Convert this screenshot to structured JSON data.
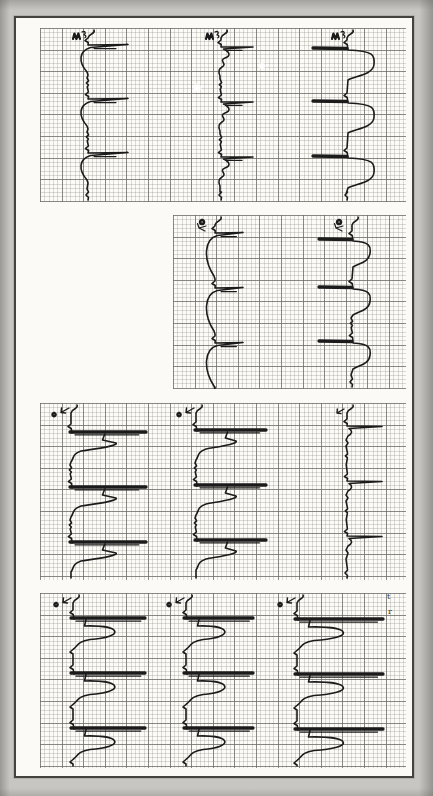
{
  "colors": {
    "background": "#c7c6c2",
    "page": "#fbfaf6",
    "page_border": "#45433e",
    "grid_major": "rgba(110,108,102,0.75)",
    "grid_minor": "rgba(125,122,112,0.26)",
    "trace": "#1b1b1b"
  },
  "chart_data": {
    "type": "line",
    "paper": {
      "minor_square_px": 4.32,
      "major_square_px": 21.6
    },
    "page": {
      "x": 14,
      "y": 16,
      "w": 400,
      "h": 762
    },
    "panels": [
      {
        "name": "panel-1",
        "x": 40,
        "y": 28,
        "w": 366,
        "h": 174,
        "strips": [
          {
            "name": "p1-s1",
            "x": 88,
            "mark": "m-squiggle",
            "style": "spike-t-left",
            "beats": [
              46,
              100,
              154
            ],
            "spike": 40,
            "t_amp": 9,
            "t_len": 26
          },
          {
            "name": "p1-s2",
            "x": 221,
            "mark": "m-squiggle",
            "style": "spike-s",
            "beats": [
              48,
              103,
              158
            ],
            "spike": 32
          },
          {
            "name": "p1-s3",
            "x": 347,
            "mark": "m-squiggle",
            "style": "bar-hump",
            "beats": [
              48,
              101,
              156
            ],
            "bar": 34,
            "hump": 27,
            "hump_len": 30
          }
        ]
      },
      {
        "name": "panel-2",
        "x": 173,
        "y": 215,
        "w": 233,
        "h": 174,
        "strips": [
          {
            "name": "p2-s1",
            "x": 215,
            "mark": "dot-squiggle",
            "style": "spike-t-left",
            "beats": [
              234,
              289,
              344
            ],
            "spike": 28,
            "t_amp": 11,
            "t_len": 42
          },
          {
            "name": "p2-s2",
            "x": 352,
            "mark": "dot-squiggle",
            "style": "bar-hump",
            "beats": [
              239,
              287,
              341
            ],
            "bar": 33,
            "hump": 18,
            "hump_len": 26
          }
        ]
      },
      {
        "name": "panel-3",
        "x": 40,
        "y": 403,
        "w": 366,
        "h": 177,
        "strips": [
          {
            "name": "p3-s1",
            "x": 71,
            "mark": "dot-arrow",
            "style": "thick-hump",
            "beats": [
              432,
              487,
              542
            ],
            "spike": 75,
            "hump": 45
          },
          {
            "name": "p3-s2",
            "x": 196,
            "mark": "dot-arrow",
            "style": "thick-hump",
            "beats": [
              430,
              485,
              540
            ],
            "spike": 70,
            "hump": 40
          },
          {
            "name": "p3-s3",
            "x": 347,
            "mark": "arrow",
            "style": "thin-spike",
            "beats": [
              427,
              482,
              537
            ],
            "spike": 35
          }
        ]
      },
      {
        "name": "panel-4",
        "x": 40,
        "y": 593,
        "w": 366,
        "h": 175,
        "strips": [
          {
            "name": "p4-s1",
            "x": 73,
            "mark": "dot-arrow",
            "style": "thick-bighump",
            "beats": [
              618,
              673,
              728
            ],
            "spike": 72,
            "hump": 50
          },
          {
            "name": "p4-s2",
            "x": 186,
            "mark": "dot-arrow",
            "style": "thick-bighump",
            "beats": [
              618,
              673,
              728
            ],
            "spike": 67,
            "hump": 46
          },
          {
            "name": "p4-s3",
            "x": 297,
            "mark": "dot-arrow",
            "style": "thick-bighump",
            "beats": [
              619,
              674,
              729
            ],
            "spike": 86,
            "hump": 56
          }
        ]
      }
    ],
    "margin_letters": [
      {
        "char": "t",
        "x": 387,
        "y": 593
      },
      {
        "char": "r",
        "x": 388,
        "y": 608
      }
    ],
    "scan_spots": [
      {
        "x": 197,
        "y": 88,
        "r": 5
      },
      {
        "x": 262,
        "y": 66,
        "r": 4
      }
    ]
  }
}
